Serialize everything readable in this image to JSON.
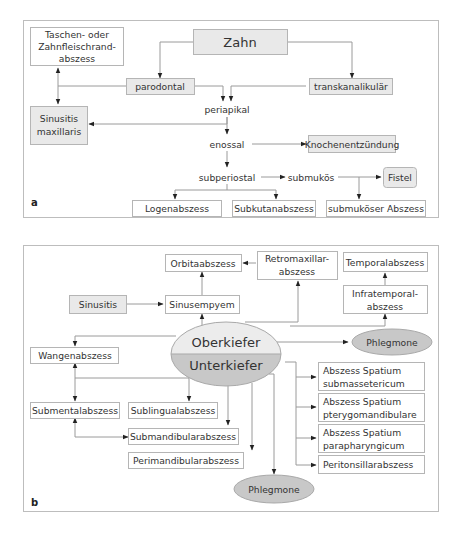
{
  "panel_a": {
    "label": "a",
    "nodes": {
      "zahn": "Zahn",
      "taschen_l1": "Taschen- oder",
      "taschen_l2": "Zahnfleischrand-",
      "taschen_l3": "abszess",
      "parodontal": "parodontal",
      "transkanalikular": "transkanalikulär",
      "periapikal": "periapikal",
      "sinusitis_l1": "Sinusitis",
      "sinusitis_l2": "maxillaris",
      "enossal": "enossal",
      "knochen": "Knochenentzündung",
      "subperiostal": "subperiostal",
      "submukos": "submukös",
      "fistel": "Fistel",
      "logen": "Logenabszess",
      "subkutan": "Subkutanabszess",
      "submukoser": "submuköser Abszess"
    }
  },
  "panel_b": {
    "label": "b",
    "nodes": {
      "orbita": "Orbitaabszess",
      "retro_l1": "Retromaxillar-",
      "retro_l2": "abszess",
      "temporal": "Temporalabszess",
      "sinusitis": "Sinusitis",
      "sinusempyem": "Sinusempyem",
      "infra_l1": "Infratemporal-",
      "infra_l2": "abszess",
      "oberkiefer": "Oberkiefer",
      "unterkiefer": "Unterkiefer",
      "phlegmone_top": "Phlegmone",
      "wangen": "Wangenabszess",
      "submental": "Submentalabszess",
      "sublingual": "Sublingualabszess",
      "submandibular": "Submandibularabszess",
      "perimandibular": "Perimandibularabszess",
      "phlegmone_bottom": "Phlegmone",
      "spatium1_l1": "Abszess Spatium",
      "spatium1_l2": "submassetericum",
      "spatium2_l1": "Abszess Spatium",
      "spatium2_l2": "pterygomandibulare",
      "spatium3_l1": "Abszess Spatium",
      "spatium3_l2": "parapharyngicum",
      "peritonsillar": "Peritonsillarabszess"
    }
  },
  "colors": {
    "box_fill_gray": "#e9e9e9",
    "ellipse_light": "#ececec",
    "ellipse_dark": "#c8c8c8",
    "line": "#9a9a9a"
  }
}
